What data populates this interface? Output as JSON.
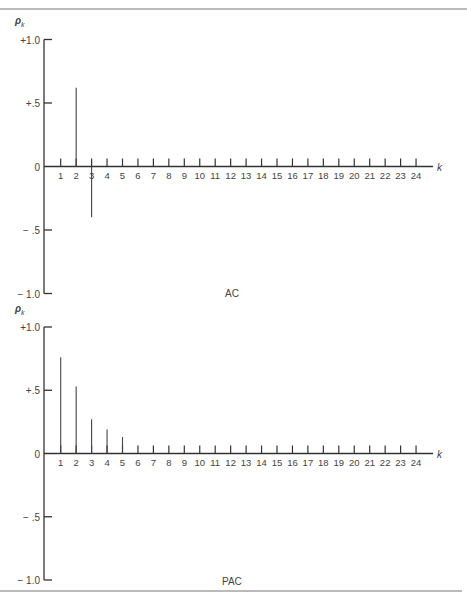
{
  "figure": {
    "bottom_caption": ""
  },
  "chart_data": [
    {
      "type": "bar",
      "title": "AC",
      "xlabel": "k",
      "ylabel": "ρ_k",
      "ylim": [
        -1.0,
        1.0
      ],
      "yticks": [
        "+1.0",
        "+.5",
        "0",
        "-.5",
        "-1.0"
      ],
      "ytick_values": [
        1.0,
        0.5,
        0,
        -0.5,
        -1.0
      ],
      "categories": [
        1,
        2,
        3,
        4,
        5,
        6,
        7,
        8,
        9,
        10,
        11,
        12,
        13,
        14,
        15,
        16,
        17,
        18,
        19,
        20,
        21,
        22,
        23,
        24
      ],
      "values": [
        0,
        0.62,
        -0.4,
        0,
        0,
        0,
        0,
        0,
        0,
        0,
        0,
        0,
        0,
        0,
        0,
        0,
        0,
        0,
        0,
        0,
        0,
        0,
        0,
        0
      ],
      "grid": false,
      "legend": null
    },
    {
      "type": "bar",
      "title": "PAC",
      "xlabel": "k",
      "ylabel": "ρ_k",
      "ylim": [
        -1.0,
        1.0
      ],
      "yticks": [
        "+1.0",
        "+.5",
        "0",
        "-.5",
        "-1.0"
      ],
      "ytick_values": [
        1.0,
        0.5,
        0,
        -0.5,
        -1.0
      ],
      "categories": [
        1,
        2,
        3,
        4,
        5,
        6,
        7,
        8,
        9,
        10,
        11,
        12,
        13,
        14,
        15,
        16,
        17,
        18,
        19,
        20,
        21,
        22,
        23,
        24
      ],
      "values": [
        0.76,
        0.53,
        0.27,
        0.19,
        0.13,
        0.07,
        0.07,
        0.07,
        0.07,
        0.07,
        0.07,
        0.07,
        0.07,
        0.07,
        0.07,
        0.07,
        0.07,
        0.07,
        0.07,
        0.07,
        0.07,
        0.07,
        0.07,
        0.07
      ],
      "grid": false,
      "legend": null
    }
  ]
}
